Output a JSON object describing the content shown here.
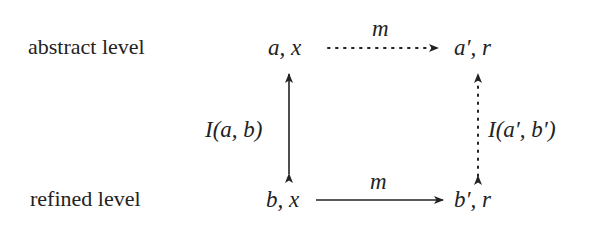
{
  "diagram": {
    "levels": {
      "abstract": "abstract level",
      "refined": "refined level"
    },
    "nodes": {
      "top_left": "a, x",
      "top_right": "a′, r",
      "bottom_left": "b, x",
      "bottom_right": "b′, r"
    },
    "edges": {
      "top": {
        "label": "m",
        "style": "dotted",
        "direction": "left-to-right"
      },
      "bottom": {
        "label": "m",
        "style": "solid",
        "direction": "left-to-right"
      },
      "left": {
        "label": "I(a, b)",
        "style": "solid",
        "direction": "bidirectional"
      },
      "right": {
        "label": "I(a′, b′)",
        "style": "dotted",
        "direction": "bidirectional"
      }
    },
    "colors": {
      "ink": "#222222",
      "background": "#ffffff"
    }
  }
}
